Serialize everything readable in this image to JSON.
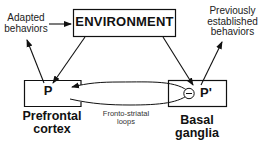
{
  "diagram": {
    "environment": {
      "label": "ENVIRONMENT"
    },
    "adapted": {
      "line1": "Adapted",
      "line2": "behaviors"
    },
    "previous": {
      "line1": "Previously",
      "line2": "established",
      "line3": "behaviors"
    },
    "pfc": {
      "node": "P",
      "line1": "Prefrontal",
      "line2": "cortex"
    },
    "bg": {
      "node": "P'",
      "inhibit_symbol": "−",
      "line1": "Basal",
      "line2": "ganglia"
    },
    "loops": {
      "line1": "Fronto-striatal",
      "line2": "loops"
    },
    "colors": {
      "stroke": "#111111",
      "text": "#111111",
      "background": "#ffffff"
    }
  }
}
